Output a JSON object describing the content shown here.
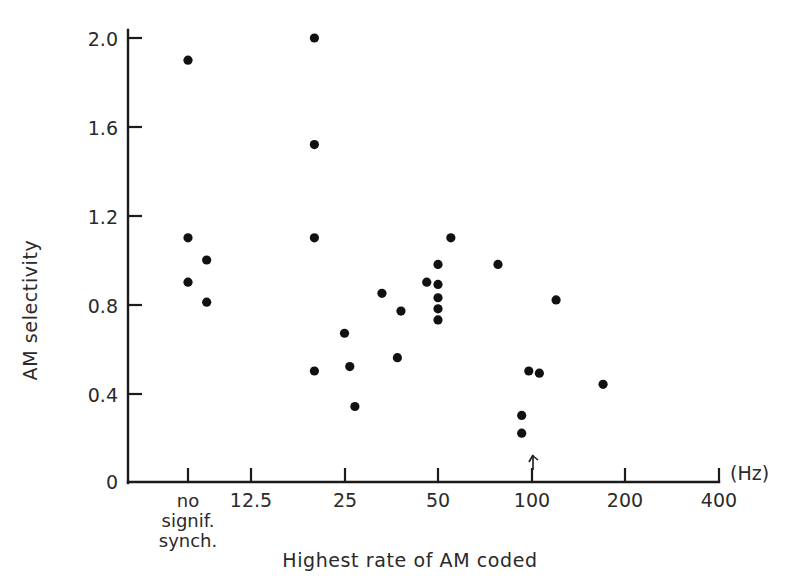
{
  "chart_data": {
    "type": "scatter",
    "title": "",
    "xlabel": "Highest rate of AM coded",
    "ylabel": "AM selectivity",
    "x_unit": "(Hz)",
    "x_scale": "log2 with categorical first tick",
    "x_tick_labels": [
      "no signif. synch.",
      "12.5",
      "25",
      "50",
      "100",
      "200",
      "400"
    ],
    "x_category_lines": [
      "no",
      "signif.",
      "synch."
    ],
    "x_numeric_ticks": [
      12.5,
      25,
      50,
      100,
      200,
      400
    ],
    "y_tick_labels": [
      "0",
      "0.4",
      "0.8",
      "1.2",
      "1.6",
      "2.0"
    ],
    "y_ticks": [
      0,
      0.4,
      0.8,
      1.2,
      1.6,
      2.0
    ],
    "ylim": [
      0,
      2.12
    ],
    "grid": "off",
    "legend": "none",
    "annotations": [
      {
        "name": "arrow-marker",
        "x": 100,
        "y": 0.1,
        "symbol": "arrow"
      }
    ],
    "points": [
      {
        "x_label": "no signif. synch.",
        "x_hz": null,
        "y": 1.9
      },
      {
        "x_label": "no signif. synch.",
        "x_hz": null,
        "y": 1.1
      },
      {
        "x_label": "no signif. synch.",
        "x_hz": null,
        "y": 0.9
      },
      {
        "x_label": "9",
        "x_hz": 9.0,
        "y": 1.0
      },
      {
        "x_label": "9",
        "x_hz": 9.0,
        "y": 0.81
      },
      {
        "x_label": "20",
        "x_hz": 20.0,
        "y": 2.0
      },
      {
        "x_label": "20",
        "x_hz": 20.0,
        "y": 1.52
      },
      {
        "x_label": "20",
        "x_hz": 20.0,
        "y": 1.1
      },
      {
        "x_label": "20",
        "x_hz": 20.0,
        "y": 0.5
      },
      {
        "x_label": "25",
        "x_hz": 25.0,
        "y": 0.67
      },
      {
        "x_label": "26",
        "x_hz": 26.0,
        "y": 0.52
      },
      {
        "x_label": "27",
        "x_hz": 27.0,
        "y": 0.34
      },
      {
        "x_label": "33",
        "x_hz": 33.0,
        "y": 0.85
      },
      {
        "x_label": "38",
        "x_hz": 38.0,
        "y": 0.77
      },
      {
        "x_label": "37",
        "x_hz": 37.0,
        "y": 0.56
      },
      {
        "x_label": "46",
        "x_hz": 46.0,
        "y": 0.9
      },
      {
        "x_label": "50",
        "x_hz": 50.0,
        "y": 0.98
      },
      {
        "x_label": "50",
        "x_hz": 50.0,
        "y": 0.89
      },
      {
        "x_label": "50",
        "x_hz": 50.0,
        "y": 0.83
      },
      {
        "x_label": "50",
        "x_hz": 50.0,
        "y": 0.78
      },
      {
        "x_label": "50",
        "x_hz": 50.0,
        "y": 0.73
      },
      {
        "x_label": "55",
        "x_hz": 55.0,
        "y": 1.1
      },
      {
        "x_label": "78",
        "x_hz": 78.0,
        "y": 0.98
      },
      {
        "x_label": "93",
        "x_hz": 93.0,
        "y": 0.3
      },
      {
        "x_label": "93",
        "x_hz": 93.0,
        "y": 0.22
      },
      {
        "x_label": "98",
        "x_hz": 98.0,
        "y": 0.5
      },
      {
        "x_label": "106",
        "x_hz": 106.0,
        "y": 0.49
      },
      {
        "x_label": "120",
        "x_hz": 120.0,
        "y": 0.82
      },
      {
        "x_label": "170",
        "x_hz": 170.0,
        "y": 0.44
      }
    ]
  },
  "axes": {
    "y_title": "AM selectivity",
    "x_title": "Highest rate of AM coded",
    "x_unit": "(Hz)",
    "y_labels": {
      "t0": "0",
      "t1": "0.4",
      "t2": "0.8",
      "t3": "1.2",
      "t4": "1.6",
      "t5": "2.0"
    },
    "x_labels": {
      "cat_line1": "no",
      "cat_line2": "signif.",
      "cat_line3": "synch.",
      "t1": "12.5",
      "t2": "25",
      "t3": "50",
      "t4": "100",
      "t5": "200",
      "t6": "400"
    }
  },
  "colors": {
    "point": "#111111",
    "axis": "#1b1b1b",
    "text": "#2a2a2a",
    "background": "#ffffff"
  }
}
